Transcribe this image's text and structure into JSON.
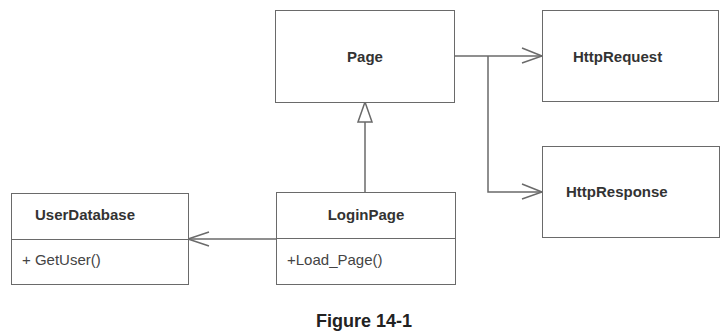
{
  "diagram": {
    "type": "UML class diagram",
    "classes": [
      {
        "id": "page",
        "name": "Page",
        "operations": []
      },
      {
        "id": "httprequest",
        "name": "HttpRequest",
        "operations": []
      },
      {
        "id": "httpresponse",
        "name": "HttpResponse",
        "operations": []
      },
      {
        "id": "loginpage",
        "name": "LoginPage",
        "operations": [
          "+Load_Page()"
        ]
      },
      {
        "id": "userdatabase",
        "name": "UserDatabase",
        "operations": [
          "+ GetUser()"
        ]
      }
    ],
    "relationships": [
      {
        "from": "LoginPage",
        "to": "Page",
        "kind": "generalization"
      },
      {
        "from": "Page",
        "to": "HttpRequest",
        "kind": "association"
      },
      {
        "from": "Page",
        "to": "HttpResponse",
        "kind": "association"
      },
      {
        "from": "LoginPage",
        "to": "UserDatabase",
        "kind": "association"
      }
    ],
    "caption": "Figure 14-1"
  }
}
